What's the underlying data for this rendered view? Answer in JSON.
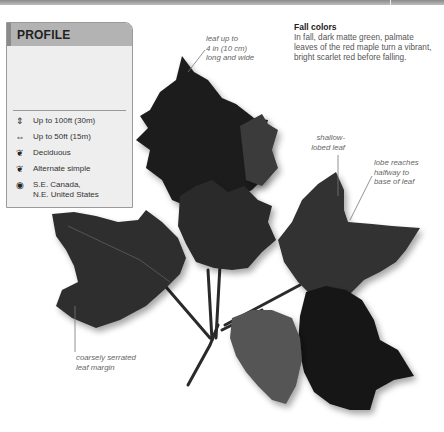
{
  "page": {
    "header_bar": "decorative-rule"
  },
  "profile": {
    "title": "PROFILE",
    "image": "tree-summer-winter-illustration",
    "facts": [
      {
        "icon": "height-icon",
        "glyph": "⇕",
        "text": "Up to 100ft (30m)"
      },
      {
        "icon": "spread-icon",
        "glyph": "⇔",
        "text": "Up to 50ft (15m)"
      },
      {
        "icon": "deciduous-leaf-icon",
        "glyph": "❦",
        "text": "Deciduous"
      },
      {
        "icon": "leaf-arrangement-icon",
        "glyph": "🍃",
        "text": "Alternate simple"
      },
      {
        "icon": "globe-region-icon",
        "glyph": "◉",
        "text": "S.E. Canada,",
        "text2": "N.E. United States"
      }
    ]
  },
  "fall_colors": {
    "heading": "Fall colors",
    "body": "In fall, dark matte green, palmate leaves of the red maple turn a vibrant, bright scarlet red before falling."
  },
  "annotations": {
    "leaf_size": [
      "leaf up to",
      "4 in (10 cm)",
      "long and wide"
    ],
    "shallow_lobed": [
      "shallow-",
      "lobed leaf"
    ],
    "lobe_reaches": [
      "lobe reaches",
      "halfway to",
      "base of leaf"
    ],
    "serrated_margin": [
      "coarsely serrated",
      "leaf margin"
    ]
  },
  "colors": {
    "leaf_dark": "#1c1c1c",
    "leaf_mid": "#3a3a3a",
    "leaf_light": "#555555",
    "panel_bg": "#eeeeee",
    "panel_header": "#b3b3b3"
  }
}
